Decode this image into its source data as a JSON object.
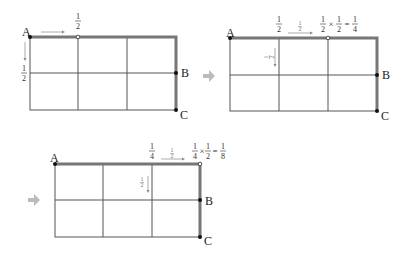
{
  "diagrams": [
    {
      "id": "step-1",
      "points": {
        "A": "A",
        "B": "B",
        "C": "C"
      },
      "top_label": {
        "num": "1",
        "den": "2"
      },
      "left_label": {
        "num": "1",
        "den": "2"
      }
    },
    {
      "id": "step-2",
      "points": {
        "A": "A",
        "B": "B",
        "C": "C"
      },
      "top_left_label": {
        "num": "1",
        "den": "2"
      },
      "arrow_label": {
        "num": "1",
        "den": "2"
      },
      "side_label": {
        "num": "1",
        "den": "2"
      },
      "equation": {
        "a_num": "1",
        "a_den": "2",
        "times": "×",
        "b_num": "1",
        "b_den": "2",
        "equals": "=",
        "r_num": "1",
        "r_den": "4"
      }
    },
    {
      "id": "step-3",
      "points": {
        "A": "A",
        "B": "B",
        "C": "C"
      },
      "top_left_label": {
        "num": "1",
        "den": "4"
      },
      "arrow_label": {
        "num": "1",
        "den": "2"
      },
      "side_label": {
        "num": "1",
        "den": "2"
      },
      "equation": {
        "a_num": "1",
        "a_den": "4",
        "times": "×",
        "b_num": "1",
        "b_den": "2",
        "equals": "=",
        "r_num": "1",
        "r_den": "8"
      }
    }
  ],
  "colors": {
    "grid": "#555555",
    "path": "#777777",
    "step_arrow": "#bbbbbb",
    "label": "#333333",
    "faint": "#888888"
  }
}
